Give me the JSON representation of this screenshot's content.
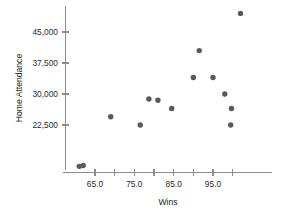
{
  "chart_data": {
    "type": "scatter",
    "title": "",
    "xlabel": "Wins",
    "ylabel": "Home Attendance",
    "xlim": [
      58.5,
      106.5
    ],
    "ylim": [
      8000,
      52500
    ],
    "grid": false,
    "legend": null,
    "marker": {
      "shape": "circle",
      "color": "#5a5a5e",
      "radius_px": 2.7
    },
    "x_ticks_major": [
      65.0,
      75.0,
      85.0,
      95.0
    ],
    "x_tick_labels": [
      "65.0",
      "75.0",
      "85.0",
      "95.0"
    ],
    "x_ticks_minor": [
      70.0,
      80.0,
      90.0,
      100.0
    ],
    "y_ticks_major": [
      22500,
      30000,
      37500,
      45000
    ],
    "y_tick_labels": [
      "22,500",
      "30,000",
      "37,500",
      "45,000"
    ],
    "points": [
      {
        "x": 61.0,
        "y": 12500
      },
      {
        "x": 62.0,
        "y": 12700
      },
      {
        "x": 69.0,
        "y": 24500
      },
      {
        "x": 76.5,
        "y": 22500
      },
      {
        "x": 78.7,
        "y": 28800
      },
      {
        "x": 81.0,
        "y": 28500
      },
      {
        "x": 84.5,
        "y": 26500
      },
      {
        "x": 90.0,
        "y": 34000
      },
      {
        "x": 91.5,
        "y": 40500
      },
      {
        "x": 95.0,
        "y": 34000
      },
      {
        "x": 98.0,
        "y": 30000
      },
      {
        "x": 99.5,
        "y": 22500
      },
      {
        "x": 99.7,
        "y": 26500
      },
      {
        "x": 102.0,
        "y": 49500
      }
    ]
  },
  "axes": {
    "x_axis_label": "Wins",
    "y_axis_label": "Home Attendance"
  },
  "colors": {
    "marker": "#5a5a5e",
    "axis": "#8c8c8c",
    "text": "#1c1c1c",
    "background": "#ffffff"
  }
}
